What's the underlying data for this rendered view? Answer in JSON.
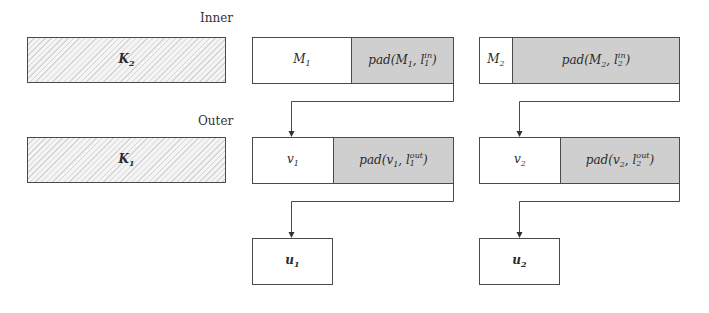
{
  "labels": {
    "inner": "Inner",
    "outer": "Outer"
  },
  "keys": {
    "k2": {
      "base": "K",
      "sub": "2"
    },
    "k1": {
      "base": "K",
      "sub": "1"
    }
  },
  "inner_row": [
    {
      "msg": {
        "base": "M",
        "sub": "1"
      },
      "pad": {
        "prefix": "pad(M",
        "arg_sub": "1",
        "l": "l",
        "l_sup": "in",
        "l_sub": "1",
        "close": ")"
      }
    },
    {
      "msg": {
        "base": "M",
        "sub": "2"
      },
      "pad": {
        "prefix": "pad(M",
        "arg_sub": "2",
        "l": "l",
        "l_sup": "in",
        "l_sub": "2",
        "close": ")"
      }
    }
  ],
  "outer_row": [
    {
      "msg": {
        "base": "v",
        "sub": "1"
      },
      "pad": {
        "prefix": "pad(v",
        "arg_sub": "1",
        "l": "l",
        "l_sup": "out",
        "l_sub": "1",
        "close": ")"
      }
    },
    {
      "msg": {
        "base": "v",
        "sub": "2"
      },
      "pad": {
        "prefix": "pad(v",
        "arg_sub": "2",
        "l": "l",
        "l_sup": "out",
        "l_sub": "2",
        "close": ")"
      }
    }
  ],
  "outputs": [
    {
      "base": "u",
      "sub": "1"
    },
    {
      "base": "u",
      "sub": "2"
    }
  ],
  "colors": {
    "pad_fill": "#cfcfcf",
    "border": "#4a4a4a",
    "key_hatch": "#d6d6d6"
  }
}
